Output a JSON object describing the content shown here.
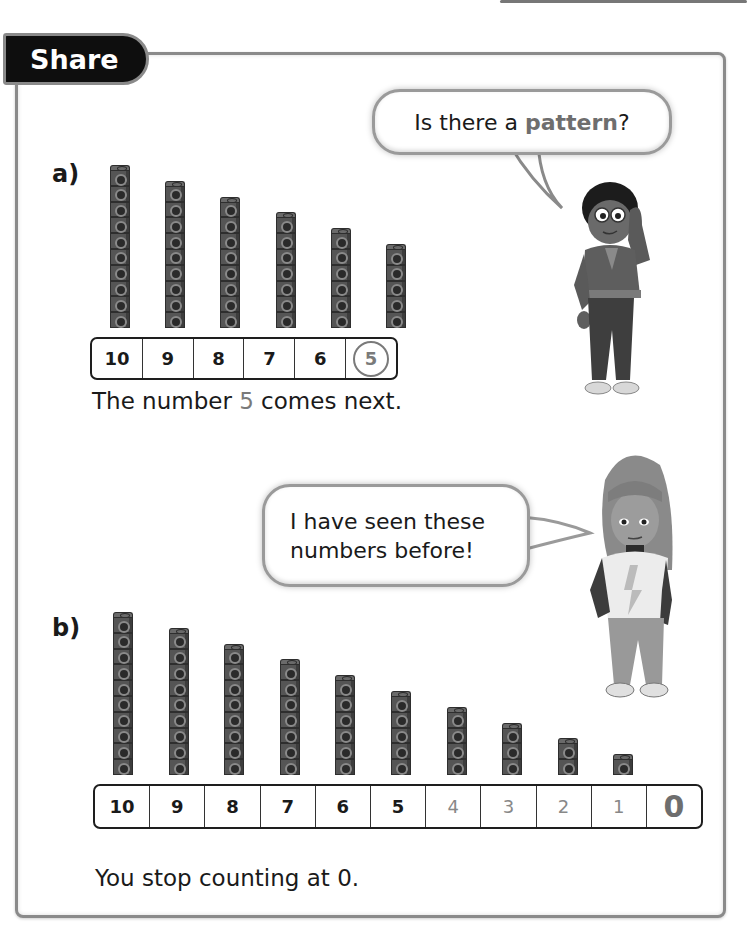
{
  "page": {
    "section_tab": "Share"
  },
  "part_a": {
    "label": "a)",
    "bubble": {
      "text_before": "Is there a ",
      "highlight": "pattern",
      "text_after": "?"
    },
    "towers": [
      10,
      9,
      8,
      7,
      6,
      5
    ],
    "track": [
      {
        "value": "10",
        "style": "bold"
      },
      {
        "value": "9",
        "style": "bold"
      },
      {
        "value": "8",
        "style": "bold"
      },
      {
        "value": "7",
        "style": "bold"
      },
      {
        "value": "6",
        "style": "bold"
      },
      {
        "value": "5",
        "style": "circled"
      }
    ],
    "caption": {
      "before": "The number ",
      "highlight": "5",
      "after": " comes next."
    }
  },
  "part_b": {
    "label": "b)",
    "bubble": {
      "line1": "I have seen these",
      "line2": "numbers before!"
    },
    "towers": [
      10,
      9,
      8,
      7,
      6,
      5,
      4,
      3,
      2,
      1
    ],
    "track": [
      {
        "value": "10",
        "style": "bold"
      },
      {
        "value": "9",
        "style": "bold"
      },
      {
        "value": "8",
        "style": "bold"
      },
      {
        "value": "7",
        "style": "bold"
      },
      {
        "value": "6",
        "style": "bold"
      },
      {
        "value": "5",
        "style": "bold"
      },
      {
        "value": "4",
        "style": "light"
      },
      {
        "value": "3",
        "style": "light"
      },
      {
        "value": "2",
        "style": "light"
      },
      {
        "value": "1",
        "style": "light"
      },
      {
        "value": "0",
        "style": "zero"
      }
    ],
    "caption": "You stop counting at 0."
  },
  "icons": {
    "boy": "boy-character-icon",
    "girl": "girl-character-icon",
    "cube": "linking-cube-icon"
  },
  "colors": {
    "tab_bg": "#0e0e0e",
    "border": "#8a8a8a",
    "highlight": "#7a7a7a",
    "cube": "#555555"
  }
}
